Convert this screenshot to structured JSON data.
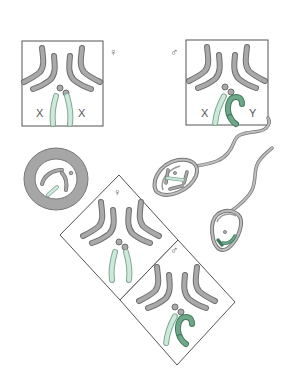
{
  "figure": {
    "type": "sex-determination-diagram",
    "colors": {
      "outline": "#555555",
      "autosome": "#a9a9a9",
      "autosome_stroke": "#6e6e6e",
      "x_chromosome": "#cfe8dc",
      "x_stroke": "#7fa893",
      "y_chromosome": "#6fa888",
      "y_stroke": "#3f7a5c",
      "cytoplasm": "#a6a6a6"
    }
  },
  "panels": {
    "female_karyotype": {
      "symbol": "♀",
      "left_label": "X",
      "right_label": "X"
    },
    "male_karyotype": {
      "symbol": "♂",
      "left_label": "X",
      "right_label": "Y"
    },
    "egg_cell": {
      "label": ""
    },
    "sperm_x": {
      "label": ""
    },
    "sperm_y": {
      "label": ""
    },
    "zygote_female": {
      "symbol": "♀"
    },
    "zygote_male": {
      "symbol": "♂"
    }
  }
}
